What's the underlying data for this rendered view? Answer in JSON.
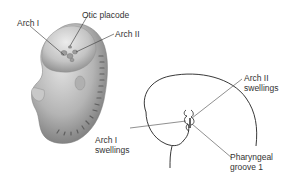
{
  "figure": {
    "panels": [
      {
        "id": "embryo-rendering",
        "description": "Shaded 3D rendering of early embryo, lateral view",
        "labels": [
          {
            "key": "arch_1",
            "text": "Arch I"
          },
          {
            "key": "otic_placode",
            "text": "Otic placode"
          },
          {
            "key": "arch_2",
            "text": "Arch II"
          }
        ]
      },
      {
        "id": "head-outline-drawing",
        "description": "Line drawing of embryonic head outline with pharyngeal swellings",
        "labels": [
          {
            "key": "arch_2_swellings",
            "line1": "Arch II",
            "line2": "swellings"
          },
          {
            "key": "arch_1_swellings",
            "line1": "Arch I",
            "line2": "swellings"
          },
          {
            "key": "pharyngeal_groove_1",
            "line1": "Pharyngeal",
            "line2": "groove 1"
          }
        ]
      }
    ]
  },
  "labels": {
    "arch_1": "Arch I",
    "otic_placode": "Otic placode",
    "arch_2": "Arch II",
    "arch_2_swellings_l1": "Arch II",
    "arch_2_swellings_l2": "swellings",
    "arch_1_swellings_l1": "Arch I",
    "arch_1_swellings_l2": "swellings",
    "pharyngeal_groove_l1": "Pharyngeal",
    "pharyngeal_groove_l2": "groove 1"
  },
  "colors": {
    "embryo_light": "#d9d9d9",
    "embryo_mid": "#a8a8a8",
    "embryo_dark": "#6e6e6e",
    "line": "#222222",
    "leader": "#444444"
  }
}
